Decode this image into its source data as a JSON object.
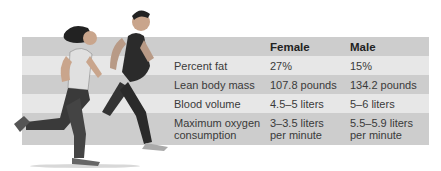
{
  "table": {
    "headers": [
      "",
      "Female",
      "Male"
    ],
    "rows": [
      {
        "label": "Percent fat",
        "female": "27%",
        "male": "15%"
      },
      {
        "label": "Lean body mass",
        "female": "107.8 pounds",
        "male": "134.2 pounds"
      },
      {
        "label": "Blood volume",
        "female": "4.5–5 liters",
        "male": "5–6 liters"
      },
      {
        "label_line1": "Maximum oxygen",
        "label_line2": "consumption",
        "female_line1": "3–3.5 liters",
        "female_line2": "per minute",
        "male_line1": "5.5–5.9 liters",
        "male_line2": "per minute"
      }
    ]
  },
  "illustration": {
    "subject": "female and male runners"
  },
  "colors": {
    "row_dark": "#cdcdcd",
    "row_light": "#e7e7e7",
    "text": "#3a3a3a"
  }
}
